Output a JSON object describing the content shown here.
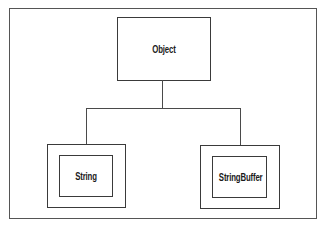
{
  "diagram": {
    "type": "class-hierarchy",
    "root": {
      "label": "Object"
    },
    "children": [
      {
        "label": "String",
        "style": "double-border"
      },
      {
        "label": "StringBuffer",
        "style": "double-border"
      }
    ],
    "edges": [
      {
        "from": "Object",
        "to": "String"
      },
      {
        "from": "Object",
        "to": "StringBuffer"
      }
    ],
    "colors": {
      "stroke": "#3a3a3a",
      "background": "#ffffff",
      "text": "#1a1a1a"
    }
  }
}
